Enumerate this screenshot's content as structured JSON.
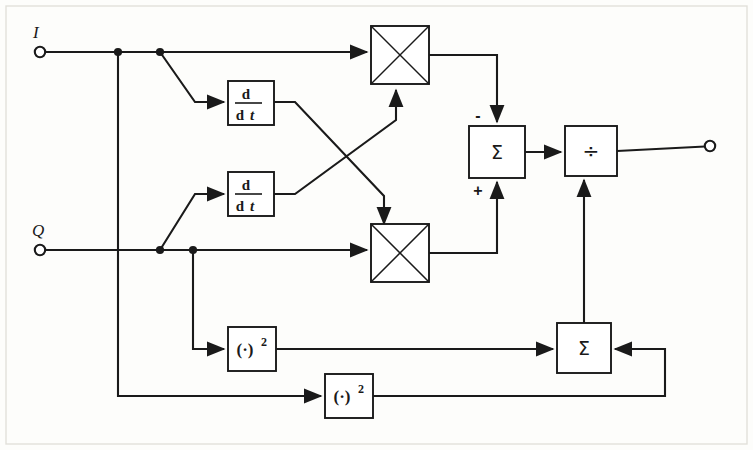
{
  "figure": {
    "type": "block-diagram",
    "canvas": {
      "width": 753,
      "height": 450,
      "background": "#fdfdfb"
    },
    "line_color": "#1a1a1a"
  },
  "ports": {
    "inputs": [
      {
        "id": "in-i",
        "label": "I",
        "x": 40,
        "y": 52
      },
      {
        "id": "in-q",
        "label": "Q",
        "x": 40,
        "y": 250
      }
    ],
    "outputs": [
      {
        "id": "out",
        "label": "",
        "x": 710,
        "y": 146
      }
    ]
  },
  "blocks": [
    {
      "id": "deriv-i",
      "name": "derivative-block-i",
      "kind": "derivative",
      "numerator": "d",
      "denominator_d": "d",
      "denominator_t": "t",
      "x": 228,
      "y": 84,
      "w": 46,
      "h": 42
    },
    {
      "id": "deriv-q",
      "name": "derivative-block-q",
      "kind": "derivative",
      "numerator": "d",
      "denominator_d": "d",
      "denominator_t": "t",
      "x": 228,
      "y": 174,
      "w": 46,
      "h": 42
    },
    {
      "id": "mult-top",
      "name": "multiplier-top",
      "kind": "multiplier",
      "label": "",
      "x": 371,
      "y": 28,
      "w": 58,
      "h": 58
    },
    {
      "id": "mult-bot",
      "name": "multiplier-bottom",
      "kind": "multiplier",
      "label": "",
      "x": 371,
      "y": 228,
      "w": 58,
      "h": 58
    },
    {
      "id": "sum-top",
      "name": "summer-top",
      "kind": "summer",
      "label": "Σ",
      "plus": "+",
      "minus": "-",
      "x": 469,
      "y": 126,
      "w": 56,
      "h": 52
    },
    {
      "id": "divider",
      "name": "divider-block",
      "kind": "divider",
      "label": "÷",
      "x": 565,
      "y": 126,
      "w": 52,
      "h": 50
    },
    {
      "id": "sq-q",
      "name": "square-block-q",
      "kind": "square",
      "base": "(·)",
      "exponent": "2",
      "x": 228,
      "y": 327,
      "w": 48,
      "h": 44
    },
    {
      "id": "sq-i",
      "name": "square-block-i",
      "kind": "square",
      "base": "(·)",
      "exponent": "2",
      "x": 325,
      "y": 374,
      "w": 48,
      "h": 44
    },
    {
      "id": "sum-bot",
      "name": "summer-bottom",
      "kind": "summer",
      "label": "Σ",
      "x": 557,
      "y": 323,
      "w": 54,
      "h": 50
    }
  ],
  "junctions": [
    {
      "id": "j-i-1",
      "name": "junction-i-square",
      "x": 118,
      "y": 52
    },
    {
      "id": "j-i-2",
      "name": "junction-i-deriv",
      "x": 160,
      "y": 52
    },
    {
      "id": "j-q-1",
      "name": "junction-q-deriv",
      "x": 160,
      "y": 250
    },
    {
      "id": "j-q-2",
      "name": "junction-q-square",
      "x": 193,
      "y": 250
    }
  ],
  "signs": {
    "minus_label": "-",
    "plus_label": "+"
  }
}
